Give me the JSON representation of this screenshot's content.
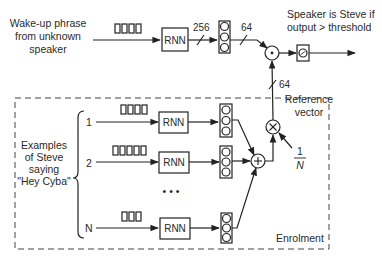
{
  "diagram": {
    "input_label": [
      "Wake-up phrase",
      "from unknown",
      "speaker"
    ],
    "output_label": [
      "Speaker is Steve if",
      "output > threshold"
    ],
    "rnn_label": "RNN",
    "dim_256": "256",
    "dim_64_top": "64",
    "dim_64_ref": "64",
    "reference_label": [
      "Reference",
      "vector"
    ],
    "scale_numerator": "1",
    "scale_denominator": "N",
    "examples_label": [
      "Examples",
      "of Steve",
      "saying",
      "\"Hey Cyba\""
    ],
    "rows": [
      {
        "index": "1",
        "frames": 4
      },
      {
        "index": "2",
        "frames": 5
      },
      {
        "index": "N",
        "frames": 3
      }
    ],
    "ellipsis": "• • •",
    "enrolment_label": "Enrolment",
    "dot_op": "dot-product",
    "mul_op": "×",
    "sum_op": "+"
  }
}
